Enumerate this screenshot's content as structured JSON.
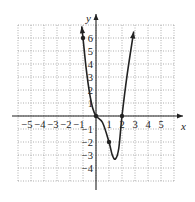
{
  "chart_data": {
    "type": "line",
    "title": "",
    "xlabel": "x",
    "ylabel": "y",
    "xlim": [
      -6,
      6
    ],
    "ylim": [
      -5,
      7
    ],
    "grid": true,
    "x_ticks": [
      -5,
      -4,
      -3,
      -2,
      -1,
      1,
      2,
      3,
      4,
      5
    ],
    "y_ticks": [
      6,
      5,
      4,
      3,
      2,
      1,
      -1,
      -2,
      -3,
      -4
    ],
    "x_tick_labels": [
      "−5",
      "−4",
      "−3",
      "−2",
      "−1",
      "1",
      "2",
      "3",
      "4",
      "5"
    ],
    "y_tick_labels": [
      "6",
      "5",
      "4",
      "3",
      "2",
      "1",
      "−1",
      "−2",
      "−3",
      "−4"
    ],
    "series": [
      {
        "name": "curve",
        "points": [
          [
            -1.1,
            6.9
          ],
          [
            -1,
            6
          ],
          [
            -0.75,
            3.6
          ],
          [
            -0.5,
            1.8
          ],
          [
            -0.25,
            0.6
          ],
          [
            0,
            0
          ],
          [
            0.5,
            -0.5
          ],
          [
            1,
            -2
          ],
          [
            1.25,
            -3.0
          ],
          [
            1.5,
            -3.3
          ],
          [
            1.75,
            -2.5
          ],
          [
            2,
            0
          ],
          [
            2.4,
            3.2
          ],
          [
            2.9,
            6.5
          ]
        ],
        "marked_points": [
          [
            -1,
            6
          ],
          [
            0,
            0
          ],
          [
            1,
            -2
          ],
          [
            2,
            0
          ]
        ],
        "arrows": [
          "start",
          "end"
        ]
      }
    ]
  }
}
